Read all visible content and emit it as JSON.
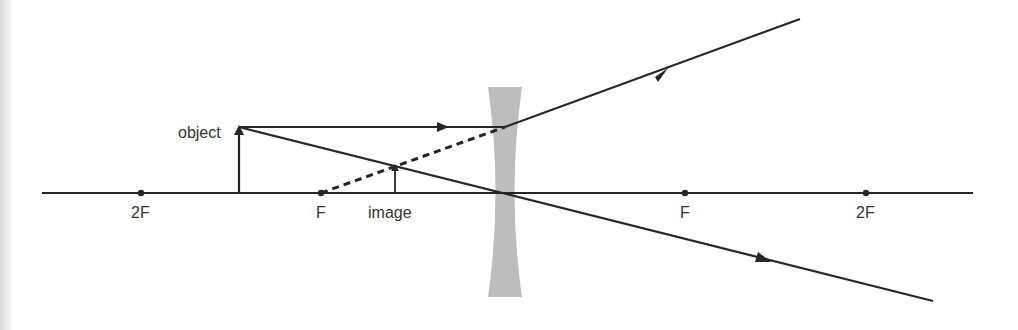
{
  "diagram": {
    "type": "ray-diagram-diverging-lens",
    "colors": {
      "line": "#262626",
      "lens": "#bdbdbd",
      "text": "#333333"
    },
    "labels": {
      "object": "object",
      "image": "image",
      "focal_left": "F",
      "focal_right": "F",
      "double_focal_left": "2F",
      "double_focal_right": "2F"
    },
    "points": {
      "axis_y": 193,
      "two_f_left_x": 141,
      "f_left_x": 321,
      "lens_x": 505,
      "f_right_x": 685,
      "two_f_right_x": 866,
      "object_x": 239,
      "object_top_y": 127,
      "image_x": 395,
      "image_top_y": 165
    }
  }
}
